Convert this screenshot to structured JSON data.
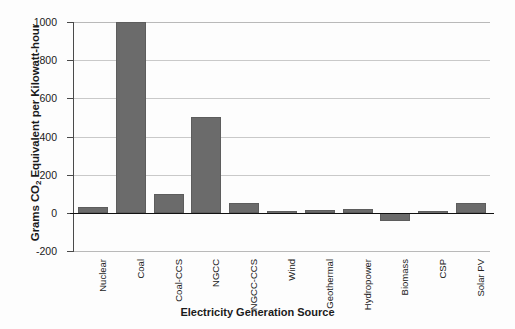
{
  "chart_data": {
    "type": "bar",
    "title": "",
    "xlabel": "Electricity Generation Source",
    "ylabel": "Grams CO2 Equivalent per Kilowatt-hour",
    "ylabel_prefix": "Grams CO",
    "ylabel_sub": "2",
    "ylabel_suffix": " Equivalent per Kilowatt-hour",
    "categories": [
      "Nuclear",
      "Coal",
      "Coal-CCS",
      "NGCC",
      "NGCC-CCS",
      "Wind",
      "Geothermal",
      "Hydropower",
      "Biomass",
      "CSP",
      "Solar PV"
    ],
    "values": [
      30,
      1000,
      100,
      500,
      50,
      12,
      15,
      20,
      -45,
      10,
      50
    ],
    "ylim": [
      -200,
      1000
    ],
    "yticks": [
      1000,
      800,
      600,
      400,
      200,
      0,
      -200
    ],
    "ytick_labels": [
      "1000",
      "800",
      "600",
      "400",
      "200",
      "0",
      "-200"
    ],
    "grid": true,
    "legend": "none",
    "bar_color": "#6b6b6b",
    "gridline_color": "#c9c9c9",
    "zero_line_color": "#111111",
    "background_color": "#fdfdfd"
  }
}
